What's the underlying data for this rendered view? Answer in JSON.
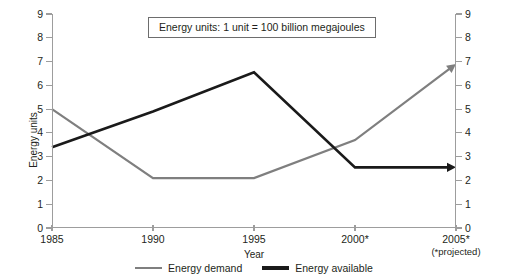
{
  "chart_data": {
    "type": "line",
    "title": "",
    "xlabel": "Year",
    "ylabel": "Energy units",
    "categories": [
      "1985",
      "1990",
      "1995",
      "2000*",
      "2005*"
    ],
    "x_tick_sub_labels": [
      "",
      "",
      "",
      "",
      "(*projected)"
    ],
    "ylim": [
      0,
      9
    ],
    "y_ticks": [
      0,
      1,
      2,
      3,
      4,
      5,
      6,
      7,
      8,
      9
    ],
    "y_tick_labels": [
      "0",
      "1",
      "2",
      "3",
      "4",
      "5",
      "6",
      "7",
      "8",
      "9"
    ],
    "dual_y_axis": true,
    "grid": false,
    "legend_position": "bottom-center",
    "annotation": "Energy units: 1 unit = 100 billion megajoules",
    "series": [
      {
        "name": "Energy demand",
        "color": "#7f7f7f",
        "arrow_end": true,
        "values": [
          5.0,
          2.1,
          2.1,
          3.7,
          6.9
        ]
      },
      {
        "name": "Energy available",
        "color": "#1a1a1a",
        "arrow_end": true,
        "values": [
          3.4,
          4.9,
          6.55,
          2.55,
          2.55
        ]
      }
    ]
  },
  "axes": {
    "y_title": "Energy units",
    "x_title": "Year",
    "axis_color": "#9d9d9d"
  },
  "annotation": {
    "text": "Energy units: 1 unit = 100 billion megajoules"
  },
  "legend": {
    "items": [
      {
        "label": "Energy demand",
        "color": "#7f7f7f"
      },
      {
        "label": "Energy available",
        "color": "#1a1a1a"
      }
    ]
  }
}
